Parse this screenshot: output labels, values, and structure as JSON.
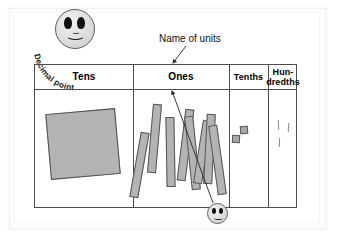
{
  "diagram": {
    "title_caption": "Decimal point",
    "callout": "Name of units",
    "table": {
      "headers": [
        {
          "label": "Tens",
          "name": "tens"
        },
        {
          "label": "Ones",
          "name": "ones"
        },
        {
          "label": "Tenths",
          "name": "tenths"
        },
        {
          "label": "Hun-",
          "label2": "dredths",
          "name": "hundredths"
        }
      ],
      "counts": {
        "tens": 1,
        "ones": 8,
        "tenths": 2,
        "hundredths": 3
      }
    },
    "colors": {
      "block_fill": "#b3b3b3",
      "block_stroke": "#4f4f4f",
      "table_border": "#4d4d4d",
      "text": "#000000",
      "arrow": "#222222",
      "page_background": "#ffffff"
    },
    "smiley_top_name": "decimal-point-smiley",
    "smiley_bottom_name": "decimal-point-marker-smiley"
  }
}
